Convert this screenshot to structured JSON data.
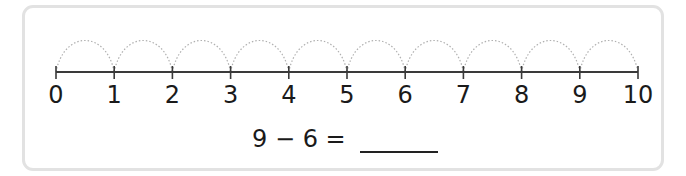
{
  "number_line": {
    "start": 0,
    "end": 10,
    "step": 1,
    "labels": [
      "0",
      "1",
      "2",
      "3",
      "4",
      "5",
      "6",
      "7",
      "8",
      "9",
      "10"
    ],
    "jumps": 10,
    "jump_style": "dotted-arc"
  },
  "equation": {
    "left_operand": "9",
    "operator": "−",
    "right_operand": "6",
    "equals": "=",
    "text": "9 − 6 =",
    "answer": ""
  },
  "colors": {
    "border": "#e2e2e2",
    "line": "#3a3a3a",
    "arc": "#b0b0b0",
    "text": "#1a1a1a"
  }
}
